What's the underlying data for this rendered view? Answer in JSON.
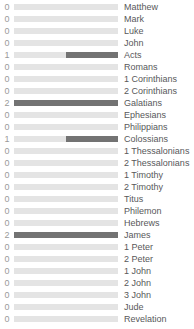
{
  "chart_data": {
    "type": "bar",
    "title": "",
    "subtitle": "",
    "xlabel": "",
    "ylabel": "",
    "orientation": "horizontal",
    "bar_anchor": "right",
    "grid": false,
    "legend": null,
    "value_labels_shown": true,
    "value_label_position": "left",
    "xlim": [
      0,
      2
    ],
    "max_value": 2,
    "colors": {
      "track": "#e4e4e4",
      "fill": "#737373",
      "value_text": "#9a9a9a",
      "label_text": "#58585a",
      "background": "#ffffff"
    },
    "categories": [
      "Matthew",
      "Mark",
      "Luke",
      "John",
      "Acts",
      "Romans",
      "1 Corinthians",
      "2 Corinthians",
      "Galatians",
      "Ephesians",
      "Philippians",
      "Colossians",
      "1 Thessalonians",
      "2 Thessalonians",
      "1 Timothy",
      "2 Timothy",
      "Titus",
      "Philemon",
      "Hebrews",
      "James",
      "1 Peter",
      "2 Peter",
      "1 John",
      "2 John",
      "3 John",
      "Jude",
      "Revelation"
    ],
    "values": [
      0,
      0,
      0,
      0,
      1,
      0,
      0,
      0,
      2,
      0,
      0,
      1,
      0,
      0,
      0,
      0,
      0,
      0,
      0,
      2,
      0,
      0,
      0,
      0,
      0,
      0,
      0
    ]
  },
  "rows": [
    {
      "value": "0",
      "label": "Matthew",
      "pct": 0
    },
    {
      "value": "0",
      "label": "Mark",
      "pct": 0
    },
    {
      "value": "0",
      "label": "Luke",
      "pct": 0
    },
    {
      "value": "0",
      "label": "John",
      "pct": 0
    },
    {
      "value": "1",
      "label": "Acts",
      "pct": 50
    },
    {
      "value": "0",
      "label": "Romans",
      "pct": 0
    },
    {
      "value": "0",
      "label": "1 Corinthians",
      "pct": 0
    },
    {
      "value": "0",
      "label": "2 Corinthians",
      "pct": 0
    },
    {
      "value": "2",
      "label": "Galatians",
      "pct": 100
    },
    {
      "value": "0",
      "label": "Ephesians",
      "pct": 0
    },
    {
      "value": "0",
      "label": "Philippians",
      "pct": 0
    },
    {
      "value": "1",
      "label": "Colossians",
      "pct": 50
    },
    {
      "value": "0",
      "label": "1 Thessalonians",
      "pct": 0
    },
    {
      "value": "0",
      "label": "2 Thessalonians",
      "pct": 0
    },
    {
      "value": "0",
      "label": "1 Timothy",
      "pct": 0
    },
    {
      "value": "0",
      "label": "2 Timothy",
      "pct": 0
    },
    {
      "value": "0",
      "label": "Titus",
      "pct": 0
    },
    {
      "value": "0",
      "label": "Philemon",
      "pct": 0
    },
    {
      "value": "0",
      "label": "Hebrews",
      "pct": 0
    },
    {
      "value": "2",
      "label": "James",
      "pct": 100
    },
    {
      "value": "0",
      "label": "1 Peter",
      "pct": 0
    },
    {
      "value": "0",
      "label": "2 Peter",
      "pct": 0
    },
    {
      "value": "0",
      "label": "1 John",
      "pct": 0
    },
    {
      "value": "0",
      "label": "2 John",
      "pct": 0
    },
    {
      "value": "0",
      "label": "3 John",
      "pct": 0
    },
    {
      "value": "0",
      "label": "Jude",
      "pct": 0
    },
    {
      "value": "0",
      "label": "Revelation",
      "pct": 0
    }
  ]
}
